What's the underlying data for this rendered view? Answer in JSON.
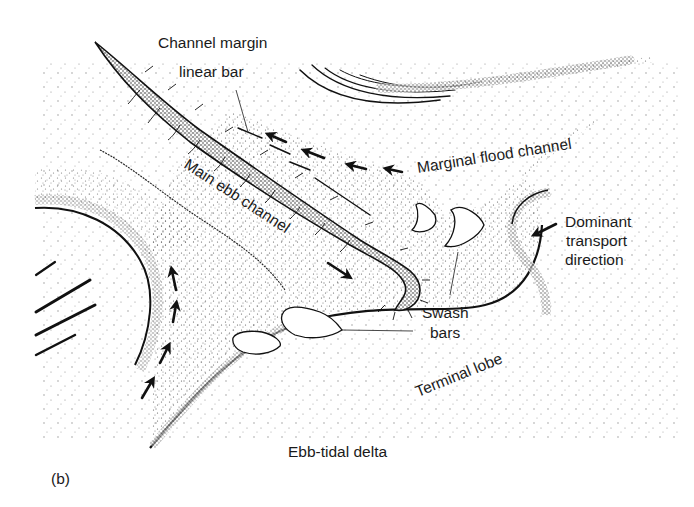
{
  "figure": {
    "panel_label": "(b)",
    "colors": {
      "ink": "#1a1a1a",
      "background": "#ffffff",
      "stipple": "#222222"
    }
  },
  "labels": {
    "channel_margin_line1": "Channel margin",
    "channel_margin_line2": "linear bar",
    "marginal_flood_channel": "Marginal flood channel",
    "main_ebb_channel": "Main ebb channel",
    "dominant_line1": "Dominant",
    "dominant_line2": "transport",
    "dominant_line3": "direction",
    "swash_line1": "Swash",
    "swash_line2": "bars",
    "terminal_lobe": "Terminal lobe",
    "ebb_tidal_delta": "Ebb-tidal delta"
  },
  "arrows": {
    "flood_channel_arrows": 4,
    "ebb_channel_arrows": 1,
    "dominant_transport_arrows": 1,
    "marginal_shoreline_arrows": 4
  }
}
